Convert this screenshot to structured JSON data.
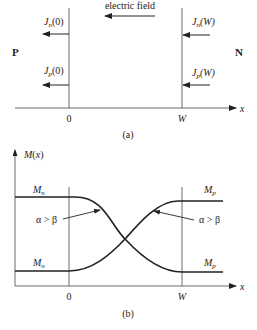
{
  "figure_a": {
    "field_label": "electric field",
    "left_region": "P",
    "right_region": "N",
    "currents": {
      "jn0": {
        "sym": "J",
        "sub": "n",
        "arg": "(0)"
      },
      "jp0": {
        "sym": "J",
        "sub": "p",
        "arg": "(0)"
      },
      "jnW": {
        "sym": "J",
        "sub": "n",
        "arg": "(W)"
      },
      "jpW": {
        "sym": "J",
        "sub": "p",
        "arg": "(W)"
      }
    },
    "tick_left": "0",
    "tick_right": "W",
    "axis_label": "x",
    "caption": "(a)"
  },
  "figure_b": {
    "y_label": "M(x)",
    "axis_label": "x",
    "tick_left": "0",
    "tick_right": "W",
    "levels": {
      "top_left": {
        "sym": "M",
        "sub": "n"
      },
      "bottom_left": {
        "sym": "M",
        "sub": "n"
      },
      "top_right": {
        "sym": "M",
        "sub": "p"
      },
      "bottom_right": {
        "sym": "M",
        "sub": "p"
      }
    },
    "annotation_left": "α > β",
    "annotation_right": "α > β",
    "caption": "(b)"
  }
}
